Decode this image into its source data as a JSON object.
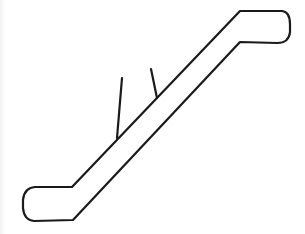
{
  "figure": {
    "style": "line-drawing",
    "stroke_color": "#1a1a1a",
    "background_color": "#ffffff",
    "stroke_width": 2.2
  }
}
